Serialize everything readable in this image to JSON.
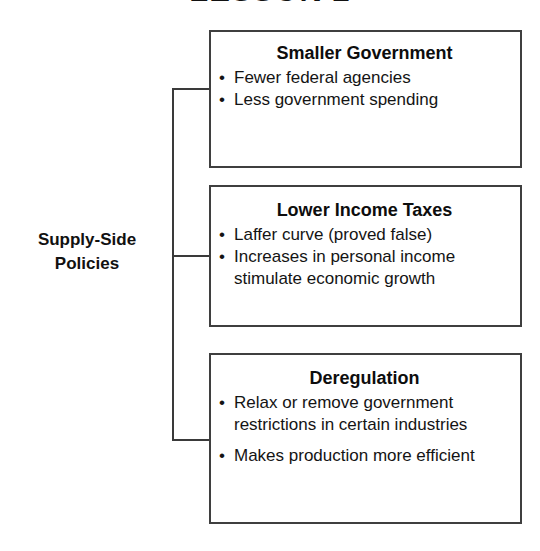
{
  "header": {
    "title": "LESSON 2"
  },
  "footer": {
    "cut_off_text": "....................."
  },
  "diagram": {
    "type": "bracket-tree",
    "root_label": "Supply-Side\nPolicies",
    "root_label_line1": "Supply-Side",
    "root_label_line2": "Policies",
    "branch_count": 3,
    "boxes": [
      {
        "title": "Smaller Government",
        "bullets": [
          "Fewer federal agencies",
          "Less government spending"
        ]
      },
      {
        "title": "Lower Income Taxes",
        "bullets": [
          "Laffer curve (proved false)",
          "Increases in personal income stimulate economic growth"
        ]
      },
      {
        "title": "Deregulation",
        "bullets": [
          "Relax or remove government restrictions in certain industries",
          "Makes production more efficient"
        ]
      }
    ]
  },
  "colors": {
    "background": "#ffffff",
    "text": "#111111",
    "border": "#3f3f3f",
    "connector": "#3a3a3a",
    "faded_text": "#b9b9b9"
  }
}
